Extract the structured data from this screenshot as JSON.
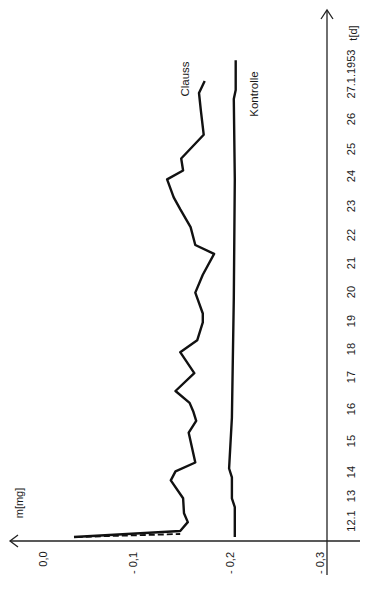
{
  "chart_data": {
    "type": "line",
    "orientation": "rotated-90-ccw",
    "title": "",
    "xlabel": "t[d]",
    "ylabel": "m[mg]",
    "x_tick_labels": [
      "12.1",
      "13",
      "14",
      "15",
      "16",
      "17",
      "18",
      "19",
      "20",
      "21",
      "22",
      "23",
      "24",
      "25",
      "26",
      "27.1.1953"
    ],
    "x_ticks": [
      12,
      13,
      14,
      15,
      16,
      17,
      18,
      19,
      20,
      21,
      22,
      23,
      24,
      25,
      26,
      27
    ],
    "y_tick_labels": [
      "0,0",
      "- 0,1",
      "- 0,2",
      "- 0,3"
    ],
    "y_ticks": [
      0.0,
      -0.1,
      -0.2,
      -0.3
    ],
    "xlim": [
      12,
      28
    ],
    "ylim": [
      -0.3,
      0.0
    ],
    "grid": false,
    "legend": "inline labels",
    "series": [
      {
        "name": "Clauss",
        "style": "solid",
        "x": [
          12.0,
          12.2,
          12.5,
          12.8,
          13.3,
          13.9,
          14.2,
          14.5,
          15.5,
          15.9,
          16.2,
          16.5,
          16.9,
          17.5,
          18.2,
          18.6,
          19.2,
          19.5,
          20.2,
          20.8,
          21.5,
          21.8,
          22.4,
          23.0,
          23.4,
          24.0,
          24.3,
          24.7,
          25.5,
          26.3,
          26.9,
          27.3
        ],
        "values": [
          -0.033,
          -0.146,
          -0.154,
          -0.15,
          -0.149,
          -0.136,
          -0.141,
          -0.162,
          -0.155,
          -0.163,
          -0.16,
          -0.156,
          -0.141,
          -0.161,
          -0.146,
          -0.164,
          -0.17,
          -0.17,
          -0.162,
          -0.17,
          -0.182,
          -0.162,
          -0.157,
          -0.146,
          -0.139,
          -0.132,
          -0.149,
          -0.147,
          -0.171,
          -0.168,
          -0.166,
          -0.172
        ]
      },
      {
        "name": "Clauss (initial, dashed)",
        "style": "dashed",
        "x": [
          12.0,
          12.1
        ],
        "values": [
          -0.036,
          -0.146
        ]
      },
      {
        "name": "Kontrolle",
        "style": "solid",
        "x": [
          12.0,
          13.0,
          13.3,
          14.0,
          14.3,
          16.0,
          20.0,
          24.0,
          26.7,
          27.0,
          28.0
        ],
        "values": [
          -0.204,
          -0.204,
          -0.201,
          -0.201,
          -0.198,
          -0.201,
          -0.203,
          -0.204,
          -0.203,
          -0.205,
          -0.205
        ]
      }
    ],
    "annotations": [
      {
        "text": "Clauss",
        "near_series": "Clauss"
      },
      {
        "text": "Kontrolle",
        "near_series": "Kontrolle"
      }
    ]
  },
  "labels": {
    "y_axis_title": "m[mg]",
    "x_axis_title": "t[d]",
    "series_clauss": "Clauss",
    "series_kontrolle": "Kontrolle",
    "y0": "0,0",
    "y1": "- 0,1",
    "y2": "- 0,2",
    "y3": "- 0,3",
    "t12": "12.1",
    "t13": "13",
    "t14": "14",
    "t15": "15",
    "t16": "16",
    "t17": "17",
    "t18": "18",
    "t19": "19",
    "t20": "20",
    "t21": "21",
    "t22": "22",
    "t23": "23",
    "t24": "24",
    "t25": "25",
    "t26": "26",
    "t27": "27.1.1953"
  }
}
